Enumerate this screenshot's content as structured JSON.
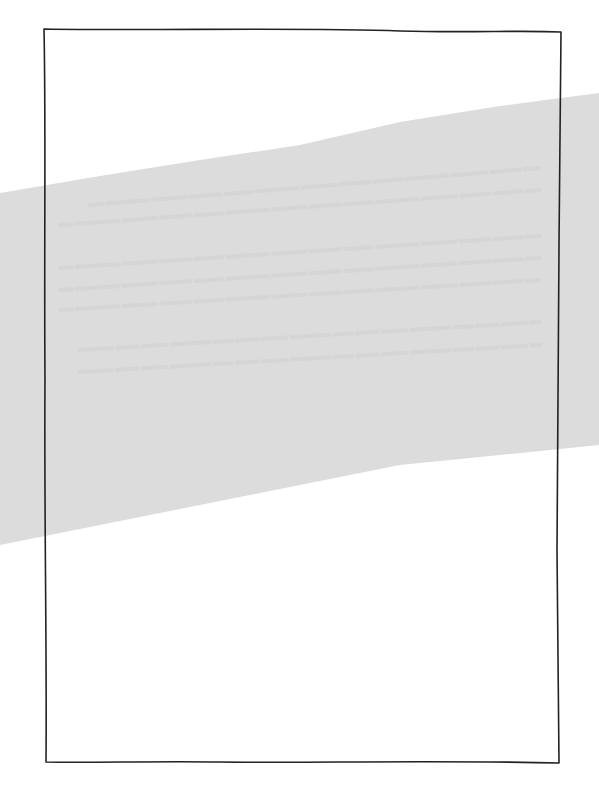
{
  "canvas": {
    "width": 599,
    "height": 799,
    "background": "#ffffff"
  },
  "band": {
    "color": "#dcdcdc",
    "ghost_text_color": "#cfcfcf",
    "top_edge": [
      [
        0,
        193
      ],
      [
        100,
        176
      ],
      [
        200,
        160
      ],
      [
        300,
        145
      ],
      [
        400,
        122
      ],
      [
        500,
        106
      ],
      [
        599,
        93
      ]
    ],
    "bottom_edge": [
      [
        599,
        445
      ],
      [
        500,
        455
      ],
      [
        400,
        465
      ],
      [
        300,
        485
      ],
      [
        200,
        505
      ],
      [
        100,
        525
      ],
      [
        0,
        545
      ]
    ],
    "ghost_text_rows": [
      {
        "y1": 205,
        "y2": 168,
        "x1": 90,
        "x2": 540
      },
      {
        "y1": 225,
        "y2": 190,
        "x1": 60,
        "x2": 540
      },
      {
        "y1": 268,
        "y2": 236,
        "x1": 60,
        "x2": 540
      },
      {
        "y1": 290,
        "y2": 258,
        "x1": 60,
        "x2": 540
      },
      {
        "y1": 310,
        "y2": 280,
        "x1": 60,
        "x2": 540
      },
      {
        "y1": 350,
        "y2": 322,
        "x1": 80,
        "x2": 540
      },
      {
        "y1": 372,
        "y2": 345,
        "x1": 80,
        "x2": 540
      }
    ]
  },
  "frame": {
    "stroke": "#222222",
    "stroke_width": 1.6,
    "path": "M44,29 C150,31 300,27 400,31 C470,33 520,30 561,32 C559,200 558,400 557,550 C558,650 559,720 559,763 C450,760 300,763 220,762 C150,761 90,763 46,762 C47,650 44,500 45,380 C44,250 46,120 44,29 Z"
  }
}
